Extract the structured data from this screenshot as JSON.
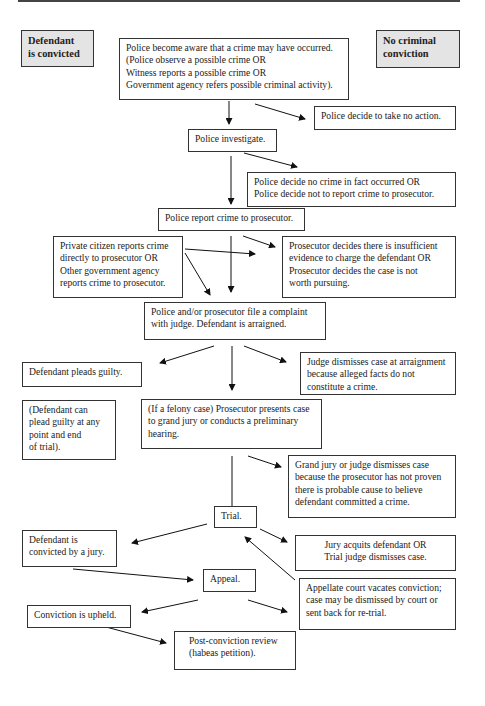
{
  "legend": {
    "convicted": "Defendant\nis convicted",
    "no_conviction": "No criminal\nconviction",
    "convicted_bg": "#e4e4e4",
    "no_conviction_bg": "#e4e4e4"
  },
  "nodes": {
    "aware": "Police become aware that a crime may have occurred.\n(Police observe a possible crime OR\nWitness reports a possible crime OR\nGovernment agency refers possible criminal activity).",
    "no_action": "Police decide to take no action.",
    "investigate": "Police investigate.",
    "no_crime": "Police decide no crime in fact occurred OR\nPolice decide not to report crime to prosecutor.",
    "report": "Police report crime to prosecutor.",
    "private": "Private citizen reports crime\ndirectly to prosecutor OR\nOther government agency\nreports crime to prosecutor.",
    "insufficient": "Prosecutor decides there is insufficient\nevidence to charge the defendant OR\nProsecutor decides the case is not\nworth pursuing.",
    "complaint": "Police and/or prosecutor file a complaint\nwith judge.  Defendant is arraigned.",
    "pleads": "Defendant pleads guilty.",
    "dismiss_arraign": "Judge dismisses case at arraignment\nbecause alleged facts do not\nconstitute a crime.",
    "plead_note": "(Defendant can\nplead guilty at any\npoint and end\nof trial).",
    "felony": "(If a felony case) Prosecutor presents case\nto grand jury or conducts a preliminary\nhearing.",
    "grand_jury": "Grand jury or judge dismisses case\nbecause the prosecutor has not proven\nthere is probable cause to believe\ndefendant committed a crime.",
    "trial": "Trial.",
    "convicted_jury": "Defendant is\nconvicted by a jury.",
    "acquits": "Jury acquits defendant OR\nTrial judge dismisses case.",
    "appeal": "Appeal.",
    "vacates": "Appellate court vacates conviction;\ncase may be dismissed by court or\nsent back for re-trial.",
    "upheld": "Conviction is upheld.",
    "habeas": "Post-conviction review\n(habeas petition)."
  }
}
